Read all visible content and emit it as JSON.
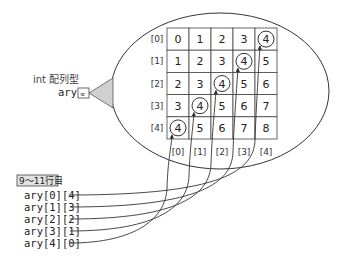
{
  "variable": {
    "type_label": "int 配列型",
    "name": "ary",
    "reference_glyph": "∝"
  },
  "array": {
    "row_labels": [
      "[0]",
      "[1]",
      "[2]",
      "[3]",
      "[4]"
    ],
    "col_labels": [
      "[0]",
      "[1]",
      "[2]",
      "[3]",
      "[4]"
    ],
    "values": [
      [
        0,
        1,
        2,
        3,
        4
      ],
      [
        1,
        2,
        3,
        4,
        5
      ],
      [
        2,
        3,
        4,
        5,
        6
      ],
      [
        3,
        4,
        5,
        6,
        7
      ],
      [
        4,
        5,
        6,
        7,
        8
      ]
    ],
    "highlighted": [
      [
        0,
        4
      ],
      [
        1,
        3
      ],
      [
        2,
        2
      ],
      [
        3,
        1
      ],
      [
        4,
        0
      ]
    ]
  },
  "callout": {
    "label": "9～11行目",
    "expressions": [
      "ary[0][4]",
      "ary[1][3]",
      "ary[2][2]",
      "ary[3][1]",
      "ary[4][0]"
    ]
  },
  "colors": {
    "line": "#333333",
    "callout_fill": "#e2e2e2",
    "pointer_fill": "#d0d0d0"
  }
}
